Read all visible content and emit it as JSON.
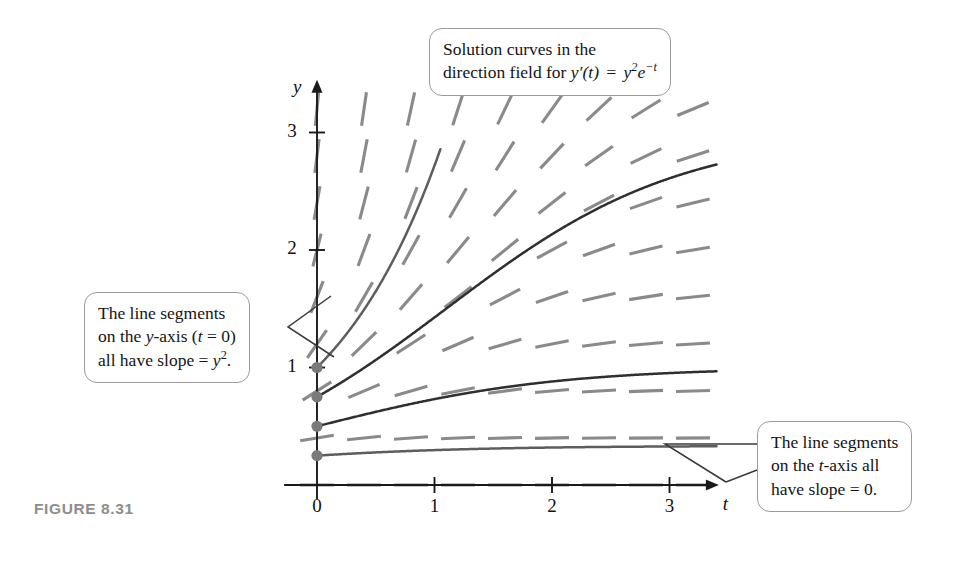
{
  "figure": {
    "caption": "FIGURE 8.31",
    "equation_display": "y′(t) = y²e⁻t"
  },
  "callouts": {
    "top": {
      "name": "solution-curves-callout",
      "line1": "Solution curves in the",
      "line2_prefix": "direction field for ",
      "line2_math": "y′(t) = y²e⁻t"
    },
    "left": {
      "name": "y-axis-slope-callout",
      "line1": "The line segments",
      "line2": "on the y-axis (t = 0)",
      "line3": "all have slope = y²."
    },
    "right": {
      "name": "t-axis-slope-callout",
      "line1": "The line segments",
      "line2": "on the t-axis all",
      "line3": "have slope = 0."
    }
  },
  "axes": {
    "x_name": "t",
    "y_name": "y",
    "x_ticks": [
      {
        "value": 0,
        "label": "0"
      },
      {
        "value": 1,
        "label": "1"
      },
      {
        "value": 2,
        "label": "2"
      },
      {
        "value": 3,
        "label": "3"
      }
    ],
    "y_ticks": [
      {
        "value": 1,
        "label": "1"
      },
      {
        "value": 2,
        "label": "2"
      },
      {
        "value": 3,
        "label": "3"
      }
    ],
    "origin_px": {
      "x": 317,
      "y": 485
    },
    "unit_px": {
      "x": 117.5,
      "y": 117.5
    },
    "x_range": [
      -0.28,
      3.42
    ],
    "y_range": [
      -0.12,
      3.45
    ]
  },
  "colors": {
    "slope_segment": "#8a8a8a",
    "solution_curve": "#5d5d5d",
    "solution_curve_dark": "#2f2f2f",
    "axis": "#1a1a1a",
    "callout_border": "#9a9a9a",
    "caption": "#8d8d8d",
    "leader_line": "#3a3a3a",
    "initial_point": "#7a7a7a"
  },
  "chart_data": {
    "type": "line",
    "xlabel": "t",
    "ylabel": "y",
    "xlim": [
      0,
      3.4
    ],
    "ylim": [
      0,
      3.4
    ],
    "grid": false,
    "legend": "none",
    "ode": {
      "expression": "y' = y^2 * exp(-t)",
      "description": "Slope at (t,y) equals y squared times e to the minus t",
      "general_solution": "y(t) = 1 / (1/y0 - 1 + e^{-t})"
    },
    "direction_field": {
      "description": "Short dashed line segments with slope y^2*e^{-t} drawn on a lattice",
      "t_samples": [
        0,
        0.4,
        0.8,
        1.2,
        1.6,
        2.0,
        2.4,
        2.8,
        3.2
      ],
      "y_samples": [
        0,
        0.4,
        0.8,
        1.2,
        1.6,
        2.0,
        2.4,
        2.8,
        3.2
      ],
      "segment_halflength_t": 0.17,
      "note_y_axis": "On the y-axis (t = 0) all segments have slope = y^2",
      "note_t_axis": "On the t-axis (y = 0) all segments have slope = 0"
    },
    "series": [
      {
        "name": "curve-y0-1.00",
        "y0": 1.0,
        "t_start": 0,
        "t_end": 1.05,
        "color_role": "solution_curve"
      },
      {
        "name": "curve-y0-0.75",
        "y0": 0.75,
        "t_start": 0,
        "t_end": 3.4,
        "color_role": "solution_curve_dark"
      },
      {
        "name": "curve-y0-0.50",
        "y0": 0.5,
        "t_start": 0,
        "t_end": 3.4,
        "color_role": "solution_curve_dark"
      },
      {
        "name": "curve-y0-0.25",
        "y0": 0.25,
        "t_start": 0,
        "t_end": 3.4,
        "color_role": "solution_curve"
      }
    ],
    "initial_points": [
      {
        "t": 0,
        "y": 1.0
      },
      {
        "t": 0,
        "y": 0.75
      },
      {
        "t": 0,
        "y": 0.5
      },
      {
        "t": 0,
        "y": 0.25
      }
    ]
  }
}
